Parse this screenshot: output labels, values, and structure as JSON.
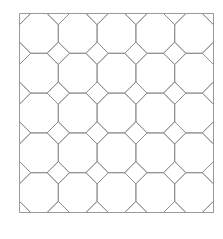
{
  "figure": {
    "name": "truncated-square-tiling",
    "background_color": "#ffffff"
  },
  "frame": {
    "x": 19.5,
    "y": 13.5,
    "width": 194,
    "height": 199,
    "stroke_color": "#9a9a9a",
    "stroke_width": 1,
    "fill": "none"
  },
  "tiling": {
    "type": "truncated-square",
    "columns": 5,
    "rows": 5,
    "cell_width": 38.8,
    "cell_height": 39.8,
    "corner_cut": 11.2,
    "stroke_color": "#8c8c8c",
    "stroke_width": 0.9,
    "octagon_count": 25,
    "square_count": 16,
    "shapes": [
      "octagon",
      "square"
    ]
  }
}
